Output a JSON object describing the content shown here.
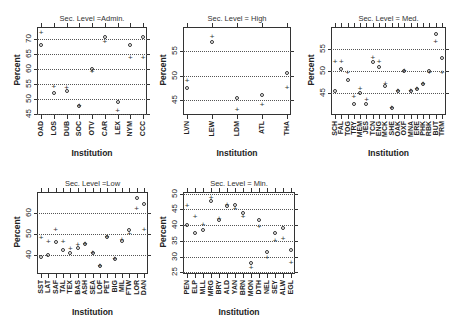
{
  "chart_data": [
    {
      "type": "scatter",
      "title": "Sec. Level =Admin.",
      "xlabel": "Institution",
      "ylabel": "Percent",
      "ylim": [
        44.5,
        74
      ],
      "yticks": [
        45,
        50,
        55,
        60,
        65,
        70
      ],
      "grid": "dotted horizontal",
      "categories": [
        "OAD",
        "LOS",
        "DUB",
        "SOC",
        "OTV",
        "CAR",
        "LEX",
        "NYM",
        "CCC"
      ],
      "series": [
        {
          "name": "plus",
          "values": [
            72,
            54,
            53.5,
            47.5,
            59,
            69,
            46,
            63.5,
            63.5
          ]
        },
        {
          "name": "circle",
          "values": [
            68,
            52,
            52.5,
            47.5,
            60,
            70.5,
            49,
            68,
            70.5
          ]
        }
      ]
    },
    {
      "type": "scatter",
      "title": "Sec. Level = High",
      "xlabel": "Institution",
      "ylabel": "Percent",
      "ylim": [
        42,
        60
      ],
      "yticks": [
        45,
        50,
        55
      ],
      "grid": "dotted horizontal",
      "categories": [
        "LVN",
        "LEW",
        "LDM",
        "ATL",
        "THA"
      ],
      "series": [
        {
          "name": "plus",
          "values": [
            49,
            58,
            43,
            44,
            47.5
          ]
        },
        {
          "name": "circle",
          "values": [
            47.5,
            57,
            45.5,
            46,
            50.5
          ]
        }
      ]
    },
    {
      "type": "scatter",
      "title": "Sec. Level = Med.",
      "xlabel": "Institution",
      "ylabel": "Percent",
      "ylim": [
        40,
        60
      ],
      "yticks": [
        45,
        50,
        55
      ],
      "grid": "dotted horizontal",
      "categories": [
        "SCH",
        "FAL",
        "TOG",
        "TRY",
        "MEM",
        "JES",
        "TCN",
        "ENG",
        "MCK",
        "SHE",
        "OAK",
        "OXF",
        "MNA",
        "ERE",
        "PHK",
        "RBK",
        "BUT",
        "TRM"
      ],
      "series": [
        {
          "name": "plus",
          "values": [
            52,
            52,
            49.5,
            44,
            46,
            43.5,
            53,
            52,
            47,
            41.5,
            45.5,
            50,
            45.5,
            46,
            47,
            49.5,
            56.5,
            49.5
          ]
        },
        {
          "name": "circle",
          "values": [
            45.5,
            50.5,
            48,
            42.5,
            45,
            42.5,
            52,
            51,
            46.5,
            41.5,
            45.5,
            50,
            45.5,
            46,
            47,
            50,
            58.5,
            53
          ]
        }
      ]
    },
    {
      "type": "scatter",
      "title": "Sec. Level =Low",
      "xlabel": "Institution",
      "ylabel": "Percent",
      "ylim": [
        31,
        70
      ],
      "yticks": [
        40,
        50,
        60
      ],
      "grid": "dotted horizontal",
      "categories": [
        "SST",
        "LAT",
        "SAF",
        "TAL",
        "TEX",
        "BAS",
        "ASH",
        "SEA",
        "LOF",
        "PET",
        "BIG",
        "MIL",
        "FTW",
        "LOR",
        "DAN"
      ],
      "series": [
        {
          "name": "plus",
          "values": [
            48,
            46,
            52,
            46,
            43,
            45,
            45.5,
            41,
            35,
            48.5,
            38,
            47,
            50,
            62,
            52
          ]
        },
        {
          "name": "circle",
          "values": [
            39,
            40,
            46,
            42.5,
            41,
            43.5,
            45.5,
            41,
            35,
            48.5,
            38,
            46.5,
            52,
            67,
            64.5
          ]
        }
      ]
    },
    {
      "type": "scatter",
      "title": "Sec. Level = Min.",
      "xlabel": "Institution",
      "ylabel": "Percent",
      "ylim": [
        24.5,
        50.5
      ],
      "yticks": [
        25,
        30,
        35,
        40,
        45,
        50
      ],
      "grid": "dotted horizontal",
      "categories": [
        "PEN",
        "ELP",
        "MLL",
        "MRG",
        "BRY",
        "ALD",
        "YAN",
        "BRN",
        "MON",
        "DTH",
        "NEL",
        "SEY",
        "ALW",
        "EGL"
      ],
      "series": [
        {
          "name": "plus",
          "values": [
            46,
            42.5,
            40,
            48.5,
            42,
            46.5,
            45,
            42.5,
            26.5,
            39.5,
            29.5,
            35,
            35.5,
            28
          ]
        },
        {
          "name": "circle",
          "values": [
            40,
            37.5,
            38.5,
            47.5,
            41.5,
            46,
            46.5,
            44,
            28,
            41.5,
            31.5,
            37.5,
            39,
            32
          ]
        }
      ]
    }
  ],
  "panels": [
    {
      "title": "Sec. Level =Admin.",
      "xlabel": "Institution",
      "ylabel": "Percent"
    },
    {
      "title": "Sec. Level = High",
      "xlabel": "Institution",
      "ylabel": "Percent"
    },
    {
      "title": "Sec. Level = Med.",
      "xlabel": "Institution",
      "ylabel": "Percent"
    },
    {
      "title": "Sec. Level =Low",
      "xlabel": "Institution",
      "ylabel": "Percent"
    },
    {
      "title": "Sec. Level = Min.",
      "xlabel": "Institution",
      "ylabel": "Percent"
    }
  ]
}
